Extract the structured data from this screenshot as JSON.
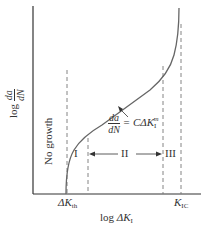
{
  "diagram": {
    "y_axis_label": {
      "prefix": "log",
      "num": "da",
      "den": "dN"
    },
    "x_axis_label": {
      "prefix": "log",
      "symbol": "ΔK",
      "sub": "I"
    },
    "x_ticks": [
      {
        "symbol": "ΔK",
        "sub": "th"
      },
      {
        "symbol": "K",
        "sub": "IC"
      }
    ],
    "regions": [
      {
        "label": "No growth"
      },
      {
        "label": "I"
      },
      {
        "label": "II"
      },
      {
        "label": "III"
      }
    ],
    "equation": {
      "num": "da",
      "den": "dN",
      "rhs_prefix": "= CΔK",
      "rhs_sub": "I",
      "rhs_sup": "m"
    },
    "colors": {
      "axis": "#333333",
      "curve": "#666666",
      "dashed": "#777777"
    }
  }
}
